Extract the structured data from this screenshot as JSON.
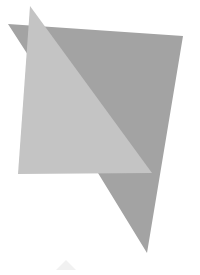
{
  "canvas": {
    "width": 200,
    "height": 275,
    "background": "#ffffff"
  },
  "shapes": {
    "dark_quad": {
      "fill": "#a3a3a3",
      "points": "8,24 183,36 147,253 98,173 28,55"
    },
    "light_triangle": {
      "fill": "#c4c4c4",
      "points": "30,6 152,173 18,174"
    },
    "faint_mark": {
      "fill": "#f1f1f1",
      "points": "56,270 66,260 76,270"
    }
  }
}
